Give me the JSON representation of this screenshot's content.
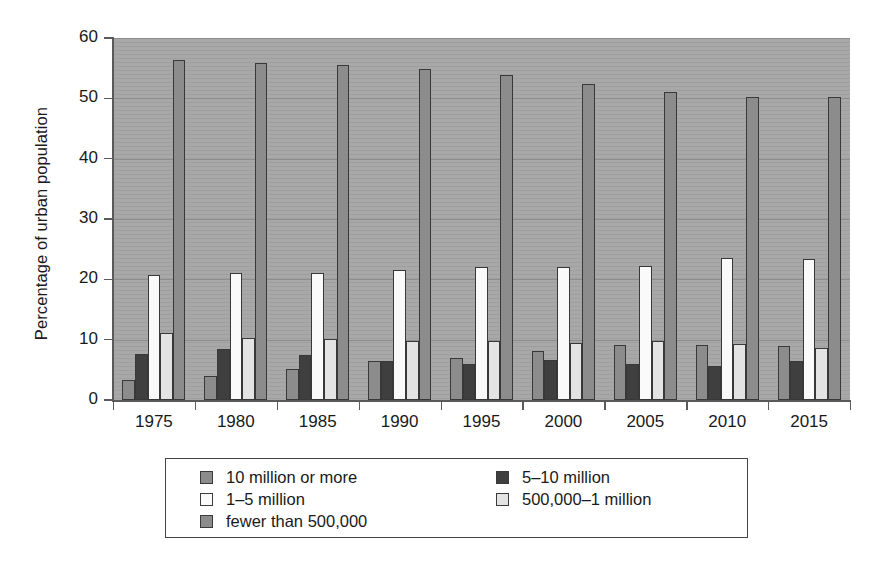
{
  "chart_data": {
    "type": "bar",
    "title": "",
    "subtitle": "",
    "xlabel": "",
    "ylabel": "Percentage of urban population",
    "categories": [
      "1975",
      "1980",
      "1985",
      "1990",
      "1995",
      "2000",
      "2005",
      "2010",
      "2015"
    ],
    "ylim": [
      0,
      60
    ],
    "yticks": [
      0,
      10,
      20,
      30,
      40,
      50,
      60
    ],
    "ytick_labels": [
      "0",
      "10",
      "20",
      "30",
      "40",
      "50",
      "60"
    ],
    "grid": true,
    "grid_axis": "y",
    "legend_position": "below-axes",
    "bar_orientation": "vertical",
    "group_mode": "clustered",
    "series": [
      {
        "name": "10 million or more",
        "color": "#8c8c8c",
        "values": [
          3.4,
          4.0,
          5.2,
          6.4,
          6.9,
          8.2,
          9.1,
          9.2,
          9.0
        ]
      },
      {
        "name": "5–10 million",
        "color": "#3f3f3f",
        "values": [
          7.6,
          8.4,
          7.5,
          6.4,
          5.9,
          6.6,
          6.0,
          5.7,
          6.5
        ]
      },
      {
        "name": "1–5 million",
        "color": "#fafafa",
        "values": [
          20.8,
          21.1,
          21.0,
          21.5,
          22.0,
          22.0,
          22.2,
          23.6,
          23.3
        ]
      },
      {
        "name": "500,000–1 million",
        "color": "#e3e3e3",
        "values": [
          11.1,
          10.2,
          10.1,
          9.8,
          9.7,
          9.5,
          9.7,
          9.3,
          8.7
        ]
      },
      {
        "name": "fewer than 500,000",
        "color": "#8c8c8c",
        "values": [
          56.4,
          55.8,
          55.5,
          54.8,
          53.8,
          52.3,
          51.1,
          50.2,
          50.2
        ]
      }
    ]
  },
  "legend": {
    "columns": [
      {
        "items": [
          {
            "label": "10 million or more",
            "color": "#8c8c8c"
          },
          {
            "label": "1–5 million",
            "color": "#fafafa"
          },
          {
            "label": "fewer than 500,000",
            "color": "#8c8c8c"
          }
        ]
      },
      {
        "items": [
          {
            "label": "5–10 million",
            "color": "#3f3f3f"
          },
          {
            "label": "500,000–1 million",
            "color": "#e3e3e3"
          }
        ]
      }
    ]
  },
  "style": {
    "plot_background": "#a8a8a8",
    "page_background": "#ffffff",
    "axis_color": "#5a5a5a",
    "gridline_color": "#8d8d8d",
    "bar_border": "#383838",
    "text_color": "#1a1a1a"
  }
}
